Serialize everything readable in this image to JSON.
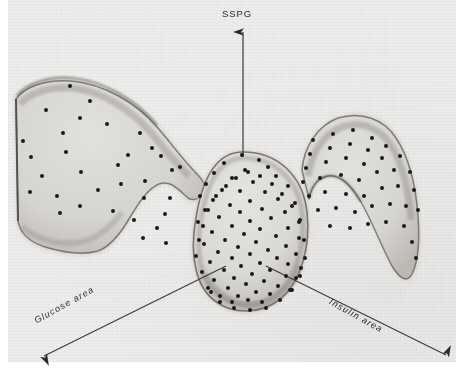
{
  "figure": {
    "title": "",
    "background_color": "#eeedeb",
    "plate_rect": [
      8,
      0,
      448,
      362
    ]
  },
  "axes": {
    "vertical": {
      "label": "SSPG",
      "label_pos": [
        222,
        8
      ],
      "line": [
        243,
        30,
        243,
        157
      ],
      "arrow": "up"
    },
    "left": {
      "label": "Glucose area",
      "label_pos": [
        35,
        316
      ],
      "rotation_deg": -29,
      "line": [
        225,
        268,
        42,
        358
      ],
      "arrow": "down-left"
    },
    "right": {
      "label": "Insulin area",
      "label_pos": [
        330,
        296
      ],
      "rotation_deg": 29,
      "line": [
        268,
        268,
        448,
        357
      ],
      "arrow": "down-right"
    }
  },
  "colors": {
    "ink": "#2b2b2b",
    "lobe_fill": "#d8d6d2",
    "lobe_rim": "#8d8a85",
    "lobe_rim_dark": "#5f5c58",
    "background": "#eeedeb",
    "dot": "#1a1a1a"
  },
  "chart_data": {
    "type": "scatter",
    "title": "",
    "xlabel": "Glucose area",
    "ylabel": "SSPG",
    "zlabel": "Insulin area",
    "projection": "3d-isometric",
    "grid": false,
    "legend": null,
    "annotations": [
      {
        "text": "SSPG",
        "role": "axis-label",
        "at": [
          243,
          14
        ]
      },
      {
        "text": "Glucose area",
        "role": "axis-label",
        "at": [
          95,
          322
        ]
      },
      {
        "text": "Insulin area",
        "role": "axis-label",
        "at": [
          372,
          310
        ]
      }
    ],
    "regions": [
      {
        "name": "left-lobe",
        "label": "high glucose area lobe",
        "path": "M 14 96 C 22 84 44 76 70 78 C 104 81 138 100 160 126 C 176 145 186 160 198 172 C 206 180 210 186 206 194 C 201 203 192 206 186 200 C 176 190 170 182 160 186 C 148 191 139 206 130 221 C 120 238 110 250 98 254 C 84 258 64 256 44 250 C 28 245 18 235 16 222 Z"
      },
      {
        "name": "center-lobe",
        "label": "central dense cluster",
        "path": "M 243 152 C 278 152 303 176 307 212 C 311 248 300 284 280 300 C 262 314 234 316 216 302 C 197 287 190 256 196 218 C 202 180 216 152 243 152 Z"
      },
      {
        "name": "right-lobe",
        "label": "high insulin area lobe",
        "path": "M 300 168 C 302 144 316 122 338 114 C 362 106 386 114 398 134 C 412 156 418 188 420 216 C 422 244 420 264 414 276 C 408 286 400 282 392 268 C 382 250 374 224 362 202 C 352 184 340 172 328 174 C 316 176 310 186 308 198 Z"
      }
    ],
    "points": {
      "marker": "filled-circle",
      "marker_size_px": 4,
      "count_total": 172,
      "groups": [
        {
          "name": "left-lobe-points",
          "count": 33,
          "xy": [
            [
              70,
              86
            ],
            [
              90,
              101
            ],
            [
              46,
              110
            ],
            [
              80,
              118
            ],
            [
              107,
              124
            ],
            [
              63,
              133
            ],
            [
              23,
              141
            ],
            [
              140,
              133
            ],
            [
              66,
              152
            ],
            [
              152,
              148
            ],
            [
              128,
              155
            ],
            [
              31,
              157
            ],
            [
              118,
              165
            ],
            [
              161,
              156
            ],
            [
              172,
              170
            ],
            [
              180,
              167
            ],
            [
              81,
              172
            ],
            [
              42,
              176
            ],
            [
              145,
              181
            ],
            [
              121,
              184
            ],
            [
              98,
              190
            ],
            [
              30,
              192
            ],
            [
              57,
              196
            ],
            [
              144,
              198
            ],
            [
              80,
              206
            ],
            [
              170,
              198
            ],
            [
              113,
              211
            ],
            [
              134,
              220
            ],
            [
              165,
              214
            ],
            [
              60,
              213
            ],
            [
              157,
              228
            ],
            [
              143,
              238
            ],
            [
              166,
              243
            ]
          ]
        },
        {
          "name": "center-lobe-points",
          "count": 96,
          "xy": [
            [
              242,
              155
            ],
            [
              224,
              163
            ],
            [
              259,
              160
            ],
            [
              268,
              167
            ],
            [
              214,
              173
            ],
            [
              245,
              170
            ],
            [
              232,
              178
            ],
            [
              276,
              176
            ],
            [
              206,
              184
            ],
            [
              253,
              182
            ],
            [
              222,
              190
            ],
            [
              288,
              186
            ],
            [
              240,
              191
            ],
            [
              265,
              192
            ],
            [
              200,
              196
            ],
            [
              213,
              200
            ],
            [
              278,
              199
            ],
            [
              250,
              201
            ],
            [
              230,
              205
            ],
            [
              295,
              203
            ],
            [
              205,
              210
            ],
            [
              262,
              209
            ],
            [
              240,
              212
            ],
            [
              285,
              212
            ],
            [
              219,
              217
            ],
            [
              271,
              218
            ],
            [
              250,
              221
            ],
            [
              198,
              222
            ],
            [
              300,
              220
            ],
            [
              232,
              226
            ],
            [
              288,
              228
            ],
            [
              260,
              229
            ],
            [
              212,
              232
            ],
            [
              244,
              234
            ],
            [
              276,
              236
            ],
            [
              225,
              240
            ],
            [
              299,
              238
            ],
            [
              256,
              242
            ],
            [
              204,
              244
            ],
            [
              238,
              247
            ],
            [
              286,
              246
            ],
            [
              268,
              250
            ],
            [
              218,
              252
            ],
            [
              250,
              254
            ],
            [
              296,
              254
            ],
            [
              232,
              258
            ],
            [
              277,
              258
            ],
            [
              210,
              262
            ],
            [
              260,
              263
            ],
            [
              288,
              264
            ],
            [
              241,
              266
            ],
            [
              224,
              270
            ],
            [
              270,
              270
            ],
            [
              301,
              268
            ],
            [
              252,
              274
            ],
            [
              234,
              278
            ],
            [
              286,
              276
            ],
            [
              214,
              280
            ],
            [
              264,
              281
            ],
            [
              296,
              278
            ],
            [
              246,
              284
            ],
            [
              228,
              288
            ],
            [
              278,
              286
            ],
            [
              256,
              292
            ],
            [
              238,
              296
            ],
            [
              270,
              294
            ],
            [
              290,
              290
            ],
            [
              248,
              300
            ],
            [
              232,
              302
            ],
            [
              262,
              302
            ],
            [
              220,
              296
            ],
            [
              208,
              288
            ],
            [
              202,
              272
            ],
            [
              196,
              256
            ],
            [
              199,
              240
            ],
            [
              203,
              226
            ],
            [
              208,
              210
            ],
            [
              216,
              196
            ],
            [
              226,
              186
            ],
            [
              236,
              178
            ],
            [
              248,
              172
            ],
            [
              260,
              176
            ],
            [
              272,
              184
            ],
            [
              282,
              194
            ],
            [
              292,
              206
            ],
            [
              299,
              222
            ],
            [
              304,
              240
            ],
            [
              305,
              258
            ],
            [
              300,
              276
            ],
            [
              292,
              290
            ],
            [
              280,
              300
            ],
            [
              266,
              308
            ],
            [
              250,
              310
            ],
            [
              234,
              308
            ],
            [
              220,
              302
            ],
            [
              211,
              292
            ]
          ]
        },
        {
          "name": "right-lobe-points",
          "count": 43,
          "xy": [
            [
              313,
              140
            ],
            [
              333,
              134
            ],
            [
              353,
              130
            ],
            [
              372,
              138
            ],
            [
              310,
              154
            ],
            [
              330,
              148
            ],
            [
              350,
              144
            ],
            [
              368,
              150
            ],
            [
              386,
              146
            ],
            [
              306,
              168
            ],
            [
              326,
              162
            ],
            [
              346,
              158
            ],
            [
              364,
              164
            ],
            [
              382,
              158
            ],
            [
              400,
              156
            ],
            [
              303,
              182
            ],
            [
              320,
              178
            ],
            [
              341,
              175
            ],
            [
              359,
              180
            ],
            [
              377,
              172
            ],
            [
              394,
              170
            ],
            [
              410,
              172
            ],
            [
              309,
              196
            ],
            [
              325,
              192
            ],
            [
              346,
              194
            ],
            [
              364,
              196
            ],
            [
              382,
              188
            ],
            [
              398,
              186
            ],
            [
              414,
              190
            ],
            [
              318,
              210
            ],
            [
              336,
              208
            ],
            [
              355,
              212
            ],
            [
              372,
              206
            ],
            [
              390,
              204
            ],
            [
              406,
              206
            ],
            [
              418,
              210
            ],
            [
              330,
              226
            ],
            [
              350,
              228
            ],
            [
              368,
              224
            ],
            [
              386,
              222
            ],
            [
              404,
              226
            ],
            [
              412,
              242
            ],
            [
              416,
              258
            ]
          ]
        }
      ]
    }
  }
}
